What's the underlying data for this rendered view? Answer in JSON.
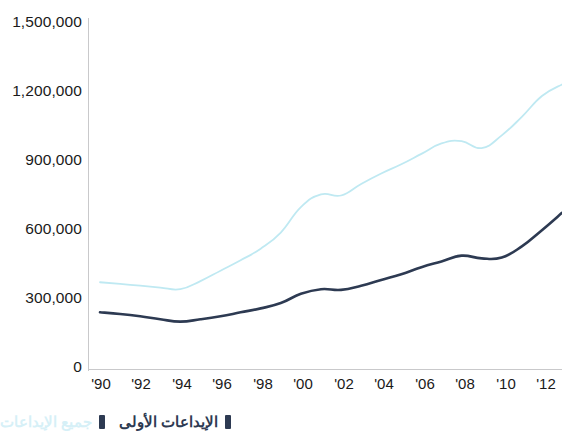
{
  "chart_data": {
    "type": "line",
    "title": "",
    "xlabel": "",
    "ylabel": "",
    "x": [
      1990,
      1991,
      1992,
      1993,
      1994,
      1995,
      1996,
      1997,
      1998,
      1999,
      2000,
      2001,
      2002,
      2003,
      2004,
      2005,
      2006,
      2007,
      2008,
      2009,
      2010,
      2011,
      2012,
      2013
    ],
    "x_tick_labels": [
      "'90",
      "'92",
      "'94",
      "'96",
      "'98",
      "'00",
      "'02",
      "'04",
      "'06",
      "'08",
      "'10",
      "'12"
    ],
    "x_tick_years": [
      1990,
      1992,
      1994,
      1996,
      1998,
      2000,
      2002,
      2004,
      2006,
      2008,
      2010,
      2012
    ],
    "y_tick_labels": [
      "1,500,000",
      "1,200,000",
      "900,000",
      "600,000",
      "300,000",
      "0"
    ],
    "y_tick_values": [
      1500000,
      1200000,
      900000,
      600000,
      300000,
      0
    ],
    "ylim": [
      0,
      1500000
    ],
    "xlim": [
      1990,
      2013
    ],
    "grid": false,
    "legend_position": "bottom-right",
    "series": [
      {
        "name": "جميع الإيداعات",
        "color": "#bfe9f2",
        "values": [
          375000,
          368000,
          360000,
          352000,
          345000,
          380000,
          425000,
          470000,
          520000,
          590000,
          700000,
          755000,
          750000,
          800000,
          845000,
          885000,
          930000,
          975000,
          985000,
          955000,
          1010000,
          1090000,
          1180000,
          1230000
        ]
      },
      {
        "name": "الإيداعات الأولى",
        "color": "#2d3a52",
        "values": [
          245000,
          238000,
          228000,
          215000,
          205000,
          215000,
          228000,
          245000,
          262000,
          285000,
          325000,
          345000,
          342000,
          360000,
          385000,
          410000,
          440000,
          465000,
          490000,
          478000,
          482000,
          530000,
          600000,
          675000
        ]
      }
    ]
  },
  "axis": {
    "y_ticks": [
      {
        "label": "1,500,000",
        "value": 1500000
      },
      {
        "label": "1,200,000",
        "value": 1200000
      },
      {
        "label": "900,000",
        "value": 900000
      },
      {
        "label": "600,000",
        "value": 600000
      },
      {
        "label": "300,000",
        "value": 300000
      },
      {
        "label": "0",
        "value": 0
      }
    ],
    "x_ticks": [
      {
        "label": "'90",
        "value": 1990
      },
      {
        "label": "'92",
        "value": 1992
      },
      {
        "label": "'94",
        "value": 1994
      },
      {
        "label": "'96",
        "value": 1996
      },
      {
        "label": "'98",
        "value": 1998
      },
      {
        "label": "'00",
        "value": 2000
      },
      {
        "label": "'02",
        "value": 2002
      },
      {
        "label": "'04",
        "value": 2004
      },
      {
        "label": "'06",
        "value": 2006
      },
      {
        "label": "'08",
        "value": 2008
      },
      {
        "label": "'10",
        "value": 2010
      },
      {
        "label": "'12",
        "value": 2012
      }
    ]
  },
  "legend": {
    "items": [
      {
        "label": "الإيداعات الأولى",
        "color": "#2d3a52",
        "swatch": "#2d3a52"
      },
      {
        "label": "جميع الإيداعات",
        "color": "#d6f0f7",
        "swatch": "#2d3a52"
      }
    ]
  },
  "colors": {
    "series_all_filings": "#bfe9f2",
    "series_first_filings": "#2d3a52",
    "axis": "#c9c9cb",
    "text": "#1a1a1a",
    "background": "#ffffff"
  }
}
